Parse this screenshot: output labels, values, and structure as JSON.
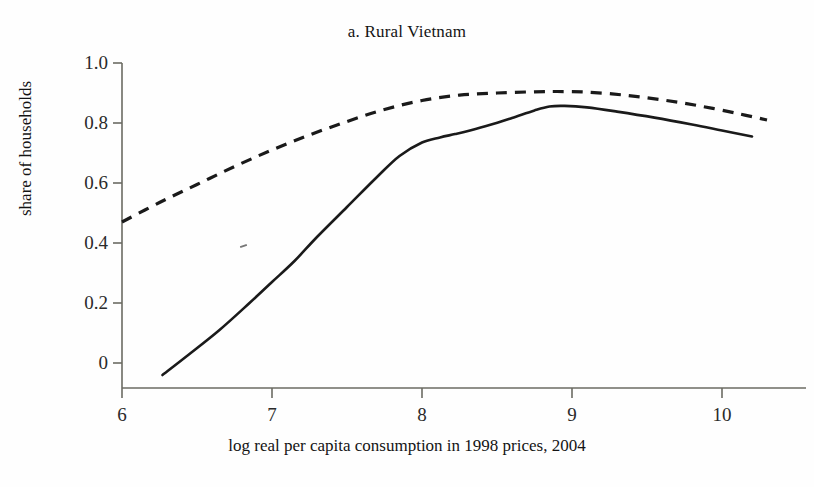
{
  "figure": {
    "title": "a. Rural Vietnam",
    "background_color": "#fefefe",
    "width": 814,
    "height": 487
  },
  "axes": {
    "x_axis_title": "log real per capita consumption in 1998 prices, 2004",
    "y_axis_title": "share of households",
    "x_tick_labels": [
      "6",
      "7",
      "8",
      "9",
      "10"
    ],
    "y_tick_labels": [
      "1.0",
      "0.8",
      "0.6",
      "0.4",
      "0.2",
      "0"
    ],
    "axis_color": "#6b6b63"
  },
  "chart_data": {
    "type": "line",
    "title": "a. Rural Vietnam",
    "xlabel": "log real per capita consumption in 1998 prices, 2004",
    "ylabel": "share of households",
    "xlim": [
      6.0,
      10.6
    ],
    "ylim": [
      -0.09,
      1.0
    ],
    "xticks": [
      6,
      7,
      8,
      9,
      10
    ],
    "yticks": [
      0,
      0.2,
      0.4,
      0.6,
      0.8,
      1.0
    ],
    "grid": false,
    "legend": "none",
    "series": [
      {
        "name": "solid-curve",
        "style": "solid",
        "color": "#1a1a1a",
        "line_width": 2.6,
        "x": [
          6.27,
          6.45,
          6.65,
          6.85,
          7.0,
          7.15,
          7.3,
          7.5,
          7.7,
          7.85,
          8.0,
          8.12,
          8.22,
          8.32,
          8.45,
          8.6,
          8.75,
          8.85,
          8.95,
          9.1,
          9.3,
          9.55,
          9.8,
          10.0,
          10.2
        ],
        "y": [
          -0.04,
          0.03,
          0.11,
          0.2,
          0.27,
          0.34,
          0.42,
          0.52,
          0.62,
          0.69,
          0.735,
          0.752,
          0.763,
          0.775,
          0.793,
          0.817,
          0.842,
          0.855,
          0.857,
          0.852,
          0.838,
          0.818,
          0.795,
          0.775,
          0.755
        ]
      },
      {
        "name": "dashed-curve",
        "style": "dashed",
        "color": "#1a1a1a",
        "line_width": 3.2,
        "dash_pattern": "11 8",
        "x": [
          6.0,
          6.25,
          6.5,
          6.75,
          7.0,
          7.25,
          7.5,
          7.75,
          8.0,
          8.25,
          8.5,
          8.75,
          8.9,
          9.1,
          9.35,
          9.6,
          9.85,
          10.1,
          10.3
        ],
        "y": [
          0.47,
          0.535,
          0.595,
          0.655,
          0.71,
          0.76,
          0.805,
          0.845,
          0.875,
          0.893,
          0.9,
          0.904,
          0.905,
          0.903,
          0.893,
          0.877,
          0.857,
          0.832,
          0.81
        ]
      }
    ]
  }
}
